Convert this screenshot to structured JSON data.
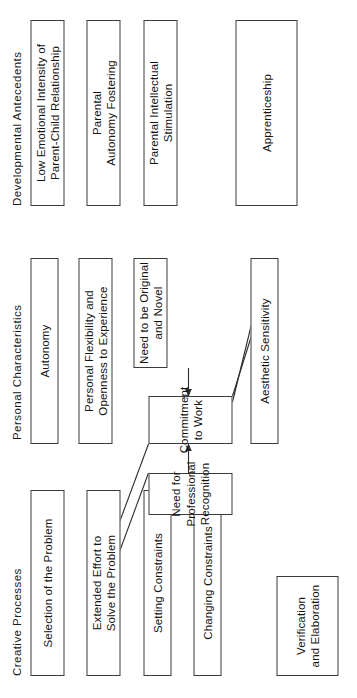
{
  "figure": {
    "caption": "Figure 6.5.  Mechanism and Elaboration Links to Personal Characteristics and Developmental",
    "columns": [
      {
        "id": "developmental-antecedents",
        "header": "Developmental Antecedents"
      },
      {
        "id": "personal-characteristics",
        "header": "Personal Characteristics"
      },
      {
        "id": "creative-processes",
        "header": "Creative Processes"
      }
    ],
    "nodes": [
      {
        "id": "low-emotional-intensity",
        "column": "developmental-antecedents",
        "label": "Low Emotional Intensity of\nParent-Child Relationship"
      },
      {
        "id": "parental-autonomy-fostering",
        "column": "developmental-antecedents",
        "label": "Parental\nAutonomy Fostering"
      },
      {
        "id": "parental-intellectual-stimulation",
        "column": "developmental-antecedents",
        "label": "Parental Intellectual\nStimulation"
      },
      {
        "id": "apprenticeship",
        "column": "developmental-antecedents",
        "label": "Apprenticeship"
      },
      {
        "id": "autonomy",
        "column": "personal-characteristics",
        "label": "Autonomy"
      },
      {
        "id": "personal-flexibility",
        "column": "personal-characteristics",
        "label": "Personal Flexibility and\nOpenness to Experience"
      },
      {
        "id": "need-to-be-original",
        "column": "personal-characteristics",
        "label": "Need to be Original\nand Novel"
      },
      {
        "id": "commitment-to-work",
        "column": "personal-characteristics",
        "label": "Commitment to Work"
      },
      {
        "id": "need-for-professional-recognition",
        "column": "personal-characteristics",
        "label": "Need for Professional\nRecognition"
      },
      {
        "id": "aesthetic-sensitivity",
        "column": "personal-characteristics",
        "label": "Aesthetic Sensitivity"
      },
      {
        "id": "selection-of-the-problem",
        "column": "creative-processes",
        "label": "Selection of the Problem"
      },
      {
        "id": "extended-effort",
        "column": "creative-processes",
        "label": "Extended Effort to\nSolve the Problem"
      },
      {
        "id": "setting-constraints",
        "column": "creative-processes",
        "label": "Setting Constraints"
      },
      {
        "id": "changing-constraints",
        "column": "creative-processes",
        "label": "Changing Constraints"
      },
      {
        "id": "verification-and-elaboration",
        "column": "creative-processes",
        "label": "Verification\nand Elaboration"
      }
    ],
    "edges": [
      {
        "from": "need-to-be-original",
        "to": "commitment-to-work",
        "arrow": true
      },
      {
        "from": "need-for-professional-recognition",
        "to": "commitment-to-work",
        "arrow": true
      },
      {
        "from": "commitment-to-work",
        "to": "verification-and-elaboration",
        "arrow": false
      },
      {
        "from": "need-for-professional-recognition",
        "to": "verification-and-elaboration",
        "arrow": false
      },
      {
        "from": "commitment-to-work",
        "to": "apprenticeship",
        "arrow": false
      },
      {
        "from": "need-for-professional-recognition",
        "to": "apprenticeship",
        "arrow": false
      }
    ],
    "colors": {
      "stroke": "#3b3b3b",
      "text": "#141414",
      "background": "#ffffff"
    }
  }
}
